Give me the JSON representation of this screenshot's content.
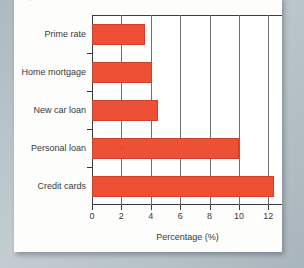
{
  "figure": {
    "caption_faint": "Figure",
    "background_color": "#b9c3c8",
    "card_color": "#fdfdfc"
  },
  "chart_data": {
    "type": "bar",
    "orientation": "horizontal",
    "title": "",
    "subtitle": "",
    "xlabel": "Percentage (%)",
    "ylabel": "",
    "categories": [
      "Prime rate",
      "Home mortgage",
      "New car loan",
      "Personal loan",
      "Credit cards"
    ],
    "values": [
      3.6,
      4.1,
      4.5,
      10.0,
      12.4
    ],
    "series": [
      {
        "name": "Percentage",
        "values": [
          3.6,
          4.1,
          4.5,
          10.0,
          12.4
        ],
        "color": "#ee5036"
      }
    ],
    "xlim": [
      0,
      13
    ],
    "ylim": [
      0,
      5
    ],
    "xticks": [
      0,
      2,
      4,
      6,
      8,
      10,
      12
    ],
    "xticklabels": [
      "0",
      "2",
      "4",
      "6",
      "8",
      "10",
      "12"
    ],
    "yticklabels": [
      "Prime rate",
      "Home mortgage",
      "New car loan",
      "Personal loan",
      "Credit cards"
    ],
    "grid": "vertical",
    "gridlines_at": [
      0,
      2,
      4,
      6,
      8,
      10,
      12
    ],
    "legend": null,
    "legend_position": "none",
    "bar_color": "#ee5036",
    "bar_edge_color": "#c8422c",
    "axis_color": "#3c3c3c",
    "plot_background": "#ffffff"
  }
}
